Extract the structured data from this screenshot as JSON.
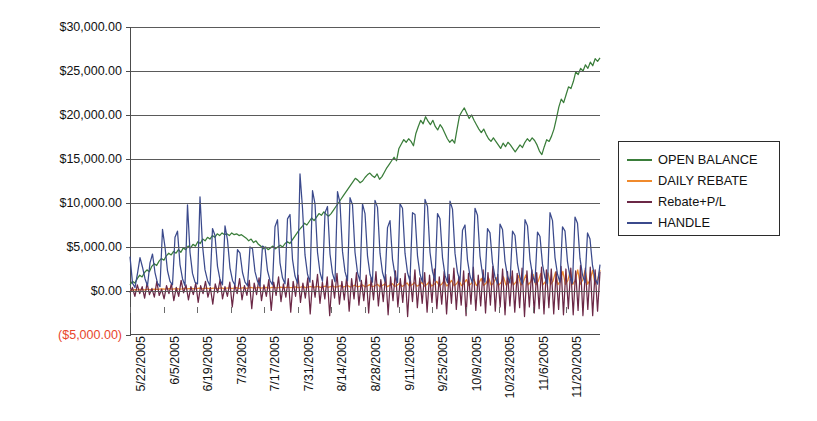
{
  "chart_data": {
    "type": "line",
    "title": "",
    "xlabel": "",
    "ylabel": "",
    "ylim": [
      -5000,
      30000
    ],
    "grid": true,
    "legend_position": "right",
    "y_tick_labels": [
      "$30,000.00",
      "$25,000.00",
      "$20,000.00",
      "$15,000.00",
      "$10,000.00",
      "$5,000.00",
      "$0.00",
      "($5,000.00)"
    ],
    "y_tick_values": [
      30000,
      25000,
      20000,
      15000,
      10000,
      5000,
      0,
      -5000
    ],
    "x_tick_labels": [
      "5/22/2005",
      "6/5/2005",
      "6/19/2005",
      "7/3/2005",
      "7/17/2005",
      "7/31/2005",
      "8/14/2005",
      "8/28/2005",
      "9/11/2005",
      "9/25/2005",
      "10/9/2005",
      "10/23/2005",
      "11/6/2005",
      "11/20/2005"
    ],
    "x_tick_day_index": [
      0,
      14,
      28,
      42,
      56,
      70,
      84,
      98,
      112,
      126,
      140,
      154,
      168,
      182
    ],
    "x_total_days": 196,
    "series": [
      {
        "name": "OPEN BALANCE",
        "color": "#3a7d3a",
        "values": [
          700,
          1100,
          900,
          1400,
          1800,
          1600,
          2100,
          2400,
          2200,
          2800,
          3100,
          2900,
          3400,
          3700,
          3500,
          4000,
          4300,
          4100,
          4500,
          4300,
          4700,
          4400,
          4900,
          4700,
          5100,
          4900,
          5300,
          5100,
          5600,
          5400,
          5900,
          5700,
          6100,
          5900,
          6300,
          6100,
          6500,
          6300,
          6600,
          6400,
          6500,
          6300,
          6600,
          6400,
          6500,
          6300,
          6400,
          6200,
          6000,
          5700,
          5900,
          5500,
          5700,
          5300,
          5100,
          4800,
          5000,
          4700,
          4900,
          5100,
          4800,
          5000,
          5200,
          5000,
          5400,
          5600,
          5400,
          5800,
          6200,
          6600,
          7000,
          7300,
          7700,
          7500,
          7900,
          8300,
          8000,
          8400,
          8800,
          8600,
          9000,
          8700,
          8500,
          8800,
          9200,
          9600,
          10000,
          10400,
          10800,
          11200,
          11600,
          12000,
          12400,
          12800,
          12600,
          12300,
          12500,
          12900,
          13200,
          13400,
          13100,
          12900,
          13300,
          12700,
          13000,
          13500,
          14000,
          14400,
          14800,
          15200,
          14800,
          16200,
          16700,
          17200,
          16900,
          17300,
          17000,
          16500,
          17900,
          18700,
          19400,
          19000,
          19800,
          19300,
          18900,
          19400,
          18700,
          18300,
          18900,
          18500,
          17900,
          17300,
          16900,
          17200,
          16800,
          18400,
          19900,
          20400,
          20800,
          20200,
          19600,
          20000,
          19400,
          18900,
          18400,
          18000,
          18400,
          17800,
          17300,
          17000,
          17400,
          17000,
          16600,
          16200,
          16800,
          16400,
          16900,
          16600,
          16200,
          15800,
          16200,
          16600,
          16300,
          16900,
          17300,
          17000,
          17400,
          17100,
          16600,
          15900,
          15500,
          16400,
          17200,
          17000,
          17600,
          18400,
          19600,
          20900,
          21800,
          21400,
          22300,
          23200,
          23000,
          23800,
          24900,
          24600,
          25300,
          25000,
          25700,
          25300,
          26000,
          25600,
          26400,
          26100,
          26500
        ]
      },
      {
        "name": "DAILY REBATE",
        "color": "#f08a2c",
        "values": [
          120,
          100,
          150,
          130,
          180,
          160,
          140,
          200,
          170,
          190,
          220,
          180,
          210,
          240,
          200,
          230,
          260,
          210,
          240,
          270,
          220,
          250,
          290,
          230,
          270,
          300,
          240,
          280,
          320,
          250,
          290,
          330,
          260,
          300,
          340,
          270,
          310,
          350,
          280,
          320,
          360,
          290,
          330,
          380,
          300,
          340,
          390,
          310,
          350,
          400,
          320,
          360,
          410,
          330,
          370,
          420,
          340,
          380,
          430,
          350,
          390,
          440,
          360,
          400,
          450,
          370,
          410,
          470,
          380,
          430,
          490,
          390,
          440,
          510,
          400,
          460,
          530,
          410,
          470,
          550,
          420,
          490,
          570,
          430,
          500,
          600,
          440,
          520,
          630,
          450,
          540,
          660,
          460,
          560,
          690,
          470,
          580,
          720,
          480,
          600,
          760,
          490,
          620,
          800,
          500,
          640,
          840,
          510,
          660,
          880,
          520,
          680,
          920,
          530,
          700,
          960,
          540,
          720,
          1000,
          550,
          740,
          1050,
          560,
          760,
          1100,
          570,
          780,
          1150,
          580,
          800,
          1200,
          590,
          820,
          1250,
          600,
          850,
          1300,
          610,
          870,
          1360,
          620,
          890,
          1420,
          630,
          910,
          1480,
          640,
          930,
          1540,
          650,
          950,
          1600,
          660,
          980,
          1680,
          670,
          1000,
          1750,
          680,
          1020,
          1820,
          690,
          1050,
          1900,
          700,
          1080,
          1980,
          710,
          1100,
          2050,
          720,
          1130,
          2150,
          730,
          1160,
          2240,
          740,
          1190,
          2330,
          750,
          1220,
          2400,
          760,
          1250,
          2380,
          770,
          1280,
          2350,
          780,
          1300,
          2400
        ]
      },
      {
        "name": "Rebate+P/L",
        "color": "#6b2846",
        "values": [
          -200,
          400,
          -600,
          700,
          -300,
          500,
          -800,
          900,
          -400,
          300,
          -700,
          1100,
          -500,
          200,
          -900,
          600,
          -300,
          800,
          -1100,
          400,
          -600,
          1200,
          -200,
          700,
          -1000,
          500,
          -400,
          900,
          -1300,
          600,
          -300,
          1100,
          -700,
          400,
          -1500,
          800,
          -200,
          1300,
          -900,
          500,
          -600,
          1000,
          -1800,
          700,
          -300,
          1400,
          -1000,
          600,
          -500,
          1200,
          -2000,
          900,
          -400,
          1500,
          -1100,
          700,
          -600,
          1300,
          -2200,
          1000,
          -500,
          1600,
          -1200,
          800,
          -700,
          1400,
          -2400,
          1100,
          -600,
          1800,
          -1300,
          900,
          -800,
          1500,
          -2600,
          1200,
          -700,
          1900,
          -1400,
          1000,
          -900,
          1600,
          -2800,
          1300,
          -800,
          2000,
          -1500,
          1100,
          -1000,
          1700,
          -2300,
          1400,
          -900,
          2100,
          -1600,
          1200,
          -1100,
          1800,
          -2500,
          1500,
          -1000,
          2200,
          -1700,
          1300,
          -1200,
          1900,
          -2700,
          1600,
          -1100,
          2300,
          -1800,
          1400,
          -1300,
          2000,
          -2900,
          1700,
          -1200,
          2400,
          -1900,
          1500,
          -1400,
          2100,
          -2400,
          1800,
          -1300,
          2500,
          -2000,
          1600,
          -1500,
          2200,
          -2600,
          1900,
          -1400,
          2600,
          -2100,
          1700,
          -1600,
          2300,
          -2800,
          2000,
          -1500,
          2700,
          -2200,
          1800,
          -1700,
          2400,
          -2500,
          2100,
          -1600,
          2800,
          -2300,
          1900,
          -1800,
          2500,
          -2700,
          2200,
          -1700,
          2300,
          -2400,
          2000,
          -1900,
          2600,
          -2900,
          2300,
          -1800,
          2400,
          -2500,
          2100,
          -2000,
          2700,
          -2600,
          2400,
          -1900,
          2500,
          -2600,
          2200,
          -2100,
          2800,
          -2700,
          2500,
          -2000,
          2600,
          -2700,
          2300,
          -2200,
          2900,
          -2800,
          2600,
          -2100,
          2700,
          -2800,
          2400,
          -2300,
          2200
        ]
      },
      {
        "name": "HANDLE",
        "color": "#3b4a8c",
        "values": [
          3900,
          900,
          400,
          2000,
          3800,
          2700,
          1400,
          600,
          3200,
          4200,
          2100,
          900,
          500,
          7000,
          5000,
          2300,
          1100,
          700,
          6100,
          6800,
          3000,
          1400,
          600,
          9800,
          4400,
          2000,
          1000,
          800,
          10700,
          5200,
          2400,
          1200,
          600,
          7100,
          6300,
          2800,
          1300,
          700,
          7400,
          5800,
          2600,
          1200,
          650,
          4700,
          4300,
          2100,
          1000,
          600,
          5000,
          4800,
          2200,
          1100,
          550,
          5100,
          4900,
          2300,
          1200,
          700,
          7300,
          8100,
          3200,
          1500,
          800,
          8200,
          8700,
          3600,
          1700,
          900,
          13300,
          9400,
          4100,
          1900,
          1000,
          11400,
          9900,
          4400,
          2100,
          1100,
          8900,
          9600,
          4200,
          2000,
          1050,
          11300,
          10000,
          4500,
          2200,
          1150,
          10600,
          9800,
          4400,
          2100,
          1100,
          9900,
          8800,
          4000,
          1900,
          1000,
          10300,
          9500,
          4300,
          2100,
          1100,
          7200,
          8000,
          3600,
          1800,
          950,
          9900,
          9400,
          4300,
          2100,
          1100,
          8900,
          8700,
          4000,
          1900,
          1000,
          10400,
          9600,
          4400,
          2200,
          1150,
          8800,
          8200,
          3800,
          1800,
          950,
          10200,
          9300,
          4300,
          2100,
          1100,
          6900,
          7500,
          3500,
          1700,
          900,
          9400,
          8600,
          4000,
          1900,
          1000,
          7100,
          6600,
          3200,
          1600,
          850,
          7600,
          7000,
          3400,
          1700,
          900,
          6800,
          6300,
          3100,
          1500,
          800,
          8100,
          7400,
          3600,
          1800,
          950,
          6700,
          6200,
          3000,
          1500,
          800,
          8900,
          8000,
          3800,
          1900,
          1000,
          7300,
          6800,
          3300,
          1600,
          850,
          8400,
          7700,
          3700,
          1800,
          950,
          6600,
          5900,
          2900,
          1450,
          780,
          3000
        ]
      }
    ]
  },
  "legend": {
    "entries": [
      {
        "label": "OPEN BALANCE",
        "color": "#3a7d3a"
      },
      {
        "label": "DAILY REBATE",
        "color": "#f08a2c"
      },
      {
        "label": "Rebate+P/L",
        "color": "#6b2846"
      },
      {
        "label": "HANDLE",
        "color": "#3b4a8c"
      }
    ]
  }
}
